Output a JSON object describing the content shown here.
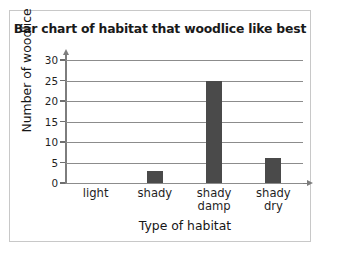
{
  "chart_data": {
    "type": "bar",
    "title": "Bar chart of habitat that woodlice like best",
    "xlabel": "Type of habitat",
    "ylabel": "Number of woodlice",
    "categories": [
      "light",
      "shady",
      "shady\ndamp",
      "shady dry"
    ],
    "values": [
      0,
      3,
      25,
      6
    ],
    "ylim": [
      0,
      30
    ],
    "yticks": [
      0,
      5,
      10,
      15,
      20,
      25,
      30
    ],
    "ytick_labels": [
      "0",
      "5",
      "10",
      "15",
      "20",
      "25",
      "30"
    ],
    "grid": "horizontal",
    "legend": "none",
    "bar_color": "#4a4a4a",
    "gridline_color": "#8c8c8c",
    "axis_color": "#7d7d7d",
    "background_color": "#ffffff",
    "border_color": "#c8c8c8"
  }
}
